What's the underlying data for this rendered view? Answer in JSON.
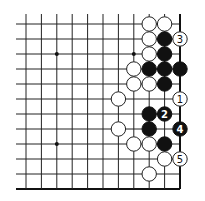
{
  "diagram": {
    "type": "go-board-fragment",
    "visible_columns": 11,
    "visible_rows": 12,
    "edges": [
      "right",
      "bottom"
    ],
    "colors": {
      "black": "#111111",
      "white": "#ffffff",
      "line": "#222222"
    },
    "star_points": [
      {
        "col": 2,
        "row": 2
      },
      {
        "col": 7,
        "row": 2
      },
      {
        "col": 2,
        "row": 8
      }
    ],
    "stones": [
      {
        "col": 8,
        "row": 0,
        "color": "white"
      },
      {
        "col": 9,
        "row": 0,
        "color": "white"
      },
      {
        "col": 8,
        "row": 1,
        "color": "white"
      },
      {
        "col": 9,
        "row": 1,
        "color": "black"
      },
      {
        "col": 10,
        "row": 1,
        "color": "white",
        "label": "3"
      },
      {
        "col": 8,
        "row": 2,
        "color": "white"
      },
      {
        "col": 9,
        "row": 2,
        "color": "black"
      },
      {
        "col": 7,
        "row": 3,
        "color": "white"
      },
      {
        "col": 8,
        "row": 3,
        "color": "black"
      },
      {
        "col": 9,
        "row": 3,
        "color": "black"
      },
      {
        "col": 10,
        "row": 3,
        "color": "black"
      },
      {
        "col": 7,
        "row": 4,
        "color": "white"
      },
      {
        "col": 8,
        "row": 4,
        "color": "white"
      },
      {
        "col": 9,
        "row": 4,
        "color": "black"
      },
      {
        "col": 6,
        "row": 5,
        "color": "white"
      },
      {
        "col": 10,
        "row": 5,
        "color": "white",
        "label": "1"
      },
      {
        "col": 8,
        "row": 6,
        "color": "black"
      },
      {
        "col": 9,
        "row": 6,
        "color": "black",
        "label": "2"
      },
      {
        "col": 6,
        "row": 7,
        "color": "white"
      },
      {
        "col": 8,
        "row": 7,
        "color": "black"
      },
      {
        "col": 10,
        "row": 7,
        "color": "black",
        "label": "4"
      },
      {
        "col": 7,
        "row": 8,
        "color": "white"
      },
      {
        "col": 8,
        "row": 8,
        "color": "white"
      },
      {
        "col": 9,
        "row": 8,
        "color": "black"
      },
      {
        "col": 9,
        "row": 9,
        "color": "white"
      },
      {
        "col": 10,
        "row": 9,
        "color": "white",
        "label": "5"
      },
      {
        "col": 8,
        "row": 10,
        "color": "white"
      }
    ],
    "move_labels": [
      "1",
      "2",
      "3",
      "4",
      "5"
    ]
  }
}
